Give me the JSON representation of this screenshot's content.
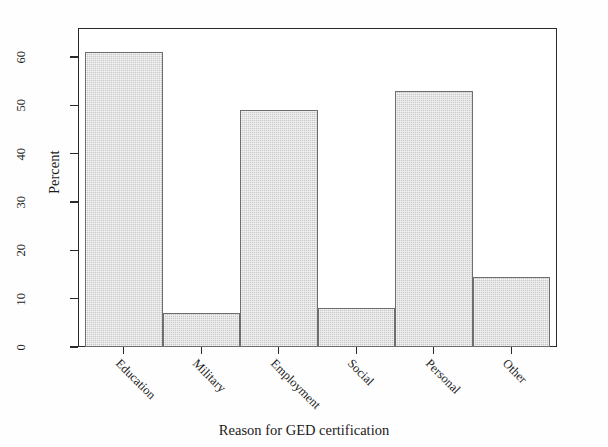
{
  "chart_data": {
    "type": "bar",
    "title": "",
    "subtitle": "",
    "xlabel": "Reason for GED certification",
    "ylabel": "Percent",
    "categories": [
      "Education",
      "Military",
      "Employment",
      "Social",
      "Personal",
      "Other"
    ],
    "values": [
      61,
      7,
      49,
      8,
      53,
      14.5
    ],
    "series": [
      {
        "name": "Percent",
        "values": [
          61,
          7,
          49,
          8,
          53,
          14.5
        ]
      }
    ],
    "ylim": [
      0,
      66
    ],
    "yticks": [
      0,
      10,
      20,
      30,
      40,
      50,
      60
    ],
    "ytick_labels": [
      "0",
      "10",
      "20",
      "30",
      "40",
      "50",
      "60"
    ],
    "xtick_label_rotation": 45,
    "ytick_label_rotation": 90,
    "grid": false,
    "legend": null,
    "legend_position": "none",
    "bar_gap": 0,
    "colors": {
      "bar_fill": "#c9c9c9",
      "bar_border": "#6e6e6e",
      "axis": "#2a2a2a",
      "text": "#1a1a1a",
      "background": "#ffffff"
    }
  }
}
